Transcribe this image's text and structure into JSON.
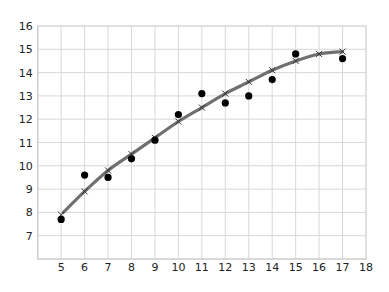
{
  "chart_data": {
    "type": "scatter",
    "title": "",
    "xlabel": "",
    "ylabel": "",
    "xlim": [
      4,
      18
    ],
    "ylim": [
      6,
      16
    ],
    "grid": true,
    "x_ticks": [
      5,
      6,
      7,
      8,
      9,
      10,
      11,
      12,
      13,
      14,
      15,
      16,
      17,
      18
    ],
    "y_ticks": [
      7,
      8,
      9,
      10,
      11,
      12,
      13,
      14,
      15,
      16
    ],
    "series": [
      {
        "name": "observed",
        "marker": "circle",
        "color": "#000000",
        "x": [
          5,
          6,
          7,
          8,
          9,
          10,
          11,
          12,
          13,
          14,
          15,
          17
        ],
        "y": [
          7.7,
          9.6,
          9.5,
          10.3,
          11.1,
          12.2,
          13.1,
          12.7,
          13.0,
          13.7,
          14.8,
          14.6
        ]
      },
      {
        "name": "fitted",
        "marker": "x",
        "line": true,
        "color": "#666666",
        "x": [
          5,
          6,
          7,
          8,
          9,
          10,
          11,
          12,
          13,
          14,
          15,
          16,
          17
        ],
        "y": [
          7.9,
          8.9,
          9.8,
          10.5,
          11.2,
          11.9,
          12.5,
          13.1,
          13.6,
          14.1,
          14.5,
          14.8,
          14.9
        ]
      }
    ]
  }
}
